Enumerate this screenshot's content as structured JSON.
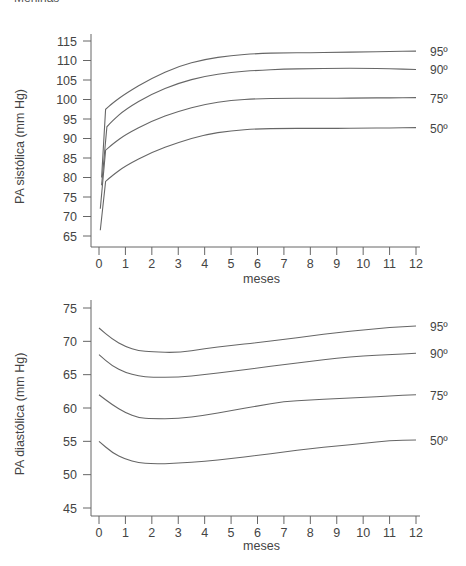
{
  "header": {
    "text": "Meninas"
  },
  "chart_data": [
    {
      "type": "line",
      "title": "",
      "xlabel": "meses",
      "ylabel": "PA sistólica (mm Hg)",
      "xlim": [
        0,
        12
      ],
      "ylim": [
        65,
        115
      ],
      "x_ticks": [
        0,
        1,
        2,
        3,
        4,
        5,
        6,
        7,
        8,
        9,
        10,
        11,
        12
      ],
      "y_ticks": [
        65,
        70,
        75,
        80,
        85,
        90,
        95,
        100,
        105,
        110,
        115
      ],
      "grid": false,
      "legend": "right-end labels",
      "series": [
        {
          "name": "95º",
          "points": [
            [
              0.1,
              80
            ],
            [
              0.25,
              97.5
            ],
            [
              0.5,
              99
            ],
            [
              1,
              101.5
            ],
            [
              2,
              105.5
            ],
            [
              3,
              108.5
            ],
            [
              4,
              110.3
            ],
            [
              5,
              111.3
            ],
            [
              6,
              111.8
            ],
            [
              7,
              112
            ],
            [
              8,
              112
            ],
            [
              9,
              112.1
            ],
            [
              10,
              112.2
            ],
            [
              11,
              112.3
            ],
            [
              12,
              112.4
            ]
          ]
        },
        {
          "name": "90º",
          "points": [
            [
              0.1,
              78
            ],
            [
              0.3,
              93
            ],
            [
              0.5,
              94.5
            ],
            [
              1,
              97.5
            ],
            [
              2,
              101.5
            ],
            [
              3,
              104.2
            ],
            [
              4,
              106
            ],
            [
              5,
              107
            ],
            [
              6,
              107.5
            ],
            [
              7,
              107.8
            ],
            [
              8,
              107.9
            ],
            [
              9,
              108
            ],
            [
              10,
              108
            ],
            [
              11,
              107.9
            ],
            [
              12,
              107.7
            ]
          ]
        },
        {
          "name": "75º",
          "points": [
            [
              0.05,
              72
            ],
            [
              0.25,
              87
            ],
            [
              0.5,
              88.5
            ],
            [
              1,
              91
            ],
            [
              2,
              94.5
            ],
            [
              3,
              97
            ],
            [
              4,
              98.8
            ],
            [
              5,
              99.8
            ],
            [
              6,
              100.2
            ],
            [
              7,
              100.3
            ],
            [
              8,
              100.3
            ],
            [
              9,
              100.3
            ],
            [
              10,
              100.4
            ],
            [
              11,
              100.4
            ],
            [
              12,
              100.5
            ]
          ]
        },
        {
          "name": "50º",
          "points": [
            [
              0.05,
              66.5
            ],
            [
              0.25,
              79
            ],
            [
              0.5,
              80.5
            ],
            [
              1,
              83
            ],
            [
              2,
              86.5
            ],
            [
              3,
              89
            ],
            [
              4,
              91
            ],
            [
              5,
              92
            ],
            [
              6,
              92.5
            ],
            [
              7,
              92.6
            ],
            [
              8,
              92.6
            ],
            [
              9,
              92.6
            ],
            [
              10,
              92.7
            ],
            [
              11,
              92.7
            ],
            [
              12,
              92.8
            ]
          ]
        }
      ]
    },
    {
      "type": "line",
      "title": "",
      "xlabel": "meses",
      "ylabel": "PA diastólica (mm Hg)",
      "xlim": [
        0,
        12
      ],
      "ylim": [
        45,
        75
      ],
      "x_ticks": [
        0,
        1,
        2,
        3,
        4,
        5,
        6,
        7,
        8,
        9,
        10,
        11,
        12
      ],
      "y_ticks": [
        45,
        50,
        55,
        60,
        65,
        70,
        75
      ],
      "grid": false,
      "legend": "right-end labels",
      "series": [
        {
          "name": "95º",
          "points": [
            [
              0,
              72
            ],
            [
              0.5,
              70.3
            ],
            [
              1,
              69.2
            ],
            [
              1.5,
              68.6
            ],
            [
              2,
              68.4
            ],
            [
              3,
              68.3
            ],
            [
              4,
              68.9
            ],
            [
              5,
              69.4
            ],
            [
              6,
              69.8
            ],
            [
              7,
              70.3
            ],
            [
              8,
              70.8
            ],
            [
              9,
              71.3
            ],
            [
              10,
              71.7
            ],
            [
              11,
              72.1
            ],
            [
              12,
              72.3
            ]
          ]
        },
        {
          "name": "90º",
          "points": [
            [
              0,
              68
            ],
            [
              0.5,
              66.3
            ],
            [
              1,
              65.3
            ],
            [
              1.5,
              64.8
            ],
            [
              2,
              64.6
            ],
            [
              3,
              64.6
            ],
            [
              4,
              65
            ],
            [
              5,
              65.5
            ],
            [
              6,
              66
            ],
            [
              7,
              66.5
            ],
            [
              8,
              67
            ],
            [
              9,
              67.5
            ],
            [
              10,
              67.8
            ],
            [
              11,
              68
            ],
            [
              12,
              68.2
            ]
          ]
        },
        {
          "name": "75º",
          "points": [
            [
              0,
              62
            ],
            [
              0.5,
              60.5
            ],
            [
              1,
              59.3
            ],
            [
              1.5,
              58.5
            ],
            [
              2,
              58.4
            ],
            [
              3,
              58.4
            ],
            [
              4,
              58.9
            ],
            [
              5,
              59.6
            ],
            [
              6,
              60.3
            ],
            [
              7,
              61
            ],
            [
              8,
              61.2
            ],
            [
              9,
              61.4
            ],
            [
              10,
              61.6
            ],
            [
              11,
              61.8
            ],
            [
              12,
              62
            ]
          ]
        },
        {
          "name": "50º",
          "points": [
            [
              0,
              55
            ],
            [
              0.5,
              53.3
            ],
            [
              1,
              52.3
            ],
            [
              1.5,
              51.8
            ],
            [
              2,
              51.6
            ],
            [
              3,
              51.7
            ],
            [
              4,
              52
            ],
            [
              5,
              52.4
            ],
            [
              6,
              52.9
            ],
            [
              7,
              53.4
            ],
            [
              8,
              53.9
            ],
            [
              9,
              54.3
            ],
            [
              10,
              54.7
            ],
            [
              11,
              55.1
            ],
            [
              12,
              55.2
            ]
          ]
        }
      ]
    }
  ]
}
